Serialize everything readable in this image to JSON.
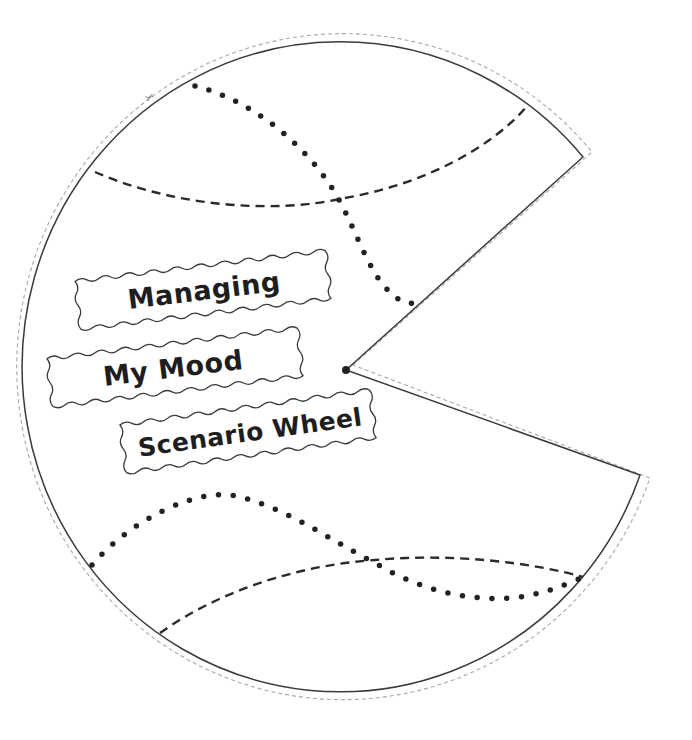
{
  "worksheet": {
    "title_lines": [
      "Managing",
      "My Mood",
      "Scenario Wheel"
    ],
    "labels": [
      {
        "id": "managing",
        "text": "Managing"
      },
      {
        "id": "my-mood",
        "text": "My Mood"
      },
      {
        "id": "scenario-wheel",
        "text": "Scenario Wheel"
      }
    ],
    "icons": {
      "scissors": "scissors-icon"
    },
    "colors": {
      "background": "#ffffff",
      "outline": "#333333",
      "cut_line": "#a0a0a0",
      "fold_lines": "#2a2a2a",
      "dots": "#222222",
      "text": "#1e1e1e"
    },
    "shape": {
      "type": "pie-wheel-with-cutout-wedge",
      "center": [
        346,
        370
      ],
      "wedge_rim_points": [
        [
          583,
          157
        ],
        [
          640,
          475
        ]
      ]
    }
  }
}
